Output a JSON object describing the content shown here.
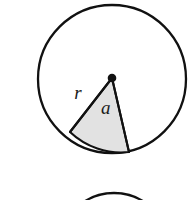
{
  "figure": {
    "kind": "geometry-diagram",
    "background_color": "#ffffff",
    "stroke_color": "#111111",
    "sector_fill_color": "#e2e2e2",
    "label_color": "#1a1a1a",
    "main_circle": {
      "name": "main-circle",
      "center_x": 112,
      "center_y": 79,
      "radius": 74,
      "stroke_width": 2.3,
      "fill": "#ffffff"
    },
    "center_point": {
      "name": "circle-center-dot",
      "x": 112,
      "y": 78,
      "radius": 4.3,
      "fill": "#111111"
    },
    "sector": {
      "name": "shaded-sector",
      "apex_x": 112,
      "apex_y": 78,
      "left_arc_x": 70,
      "left_arc_y": 132,
      "right_arc_x": 129,
      "right_arc_y": 152,
      "fill": "#e2e2e2",
      "stroke_width": 2.1
    },
    "labels": [
      {
        "name": "radius-label-r",
        "text": "r",
        "x": 78,
        "y": 99,
        "font_size": 19
      },
      {
        "name": "area-label-a",
        "text": "a",
        "x": 101,
        "y": 114,
        "font_size": 19
      }
    ],
    "second_circle": {
      "name": "second-circle-partial",
      "center_x": 114,
      "center_y": 248,
      "radius": 55,
      "stroke_width": 2.3,
      "fill": "#ffffff"
    }
  }
}
